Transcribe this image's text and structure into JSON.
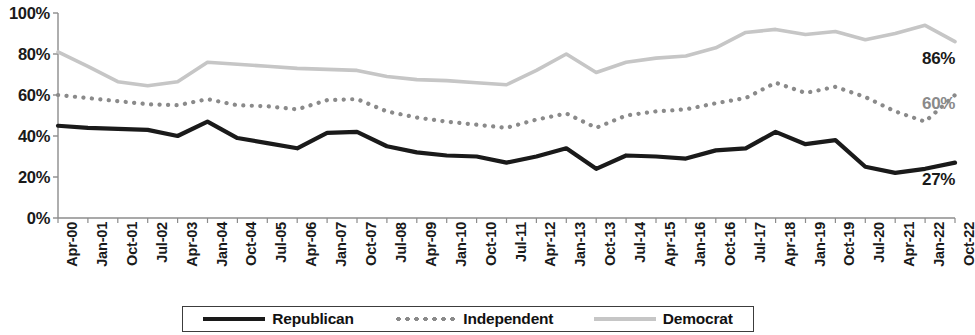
{
  "chart_data": {
    "type": "line",
    "title": "",
    "xlabel": "",
    "ylabel": "",
    "ylim": [
      0,
      100
    ],
    "ytick_labels": [
      "100%",
      "80%",
      "60%",
      "40%",
      "20%",
      "0%"
    ],
    "ytick_values": [
      100,
      80,
      60,
      40,
      20,
      0
    ],
    "grid": false,
    "legend_position": "bottom",
    "categories": [
      "Apr-00",
      "Jan-01",
      "Oct-01",
      "Jul-02",
      "Apr-03",
      "Jan-04",
      "Oct-04",
      "Jul-05",
      "Apr-06",
      "Jan-07",
      "Oct-07",
      "Jul-08",
      "Apr-09",
      "Jan-10",
      "Oct-10",
      "Jul-11",
      "Apr-12",
      "Jan-13",
      "Oct-13",
      "Jul-14",
      "Apr-15",
      "Jan-16",
      "Oct-16",
      "Jul-17",
      "Apr-18",
      "Jan-19",
      "Oct-19",
      "Jul-20",
      "Apr-21",
      "Jan-22",
      "Oct-22"
    ],
    "series": [
      {
        "name": "Republican",
        "color": "#1a1a1a",
        "style": "solid",
        "end_label": "27%",
        "values": [
          45,
          44,
          43.5,
          43,
          40,
          47,
          39,
          36.5,
          34,
          41.5,
          42,
          35,
          32,
          30.5,
          30,
          27,
          30,
          34,
          24,
          30.5,
          30,
          29,
          33,
          34,
          42,
          36,
          38,
          25,
          22,
          24,
          27
        ]
      },
      {
        "name": "Independent",
        "color": "#8a8a8a",
        "style": "dotted",
        "end_label": "60%",
        "values": [
          60,
          58.5,
          57,
          55.5,
          55,
          58,
          55,
          54.5,
          53,
          57.5,
          58,
          52,
          49,
          47,
          45.5,
          44,
          48,
          51,
          44,
          50,
          52,
          53,
          56,
          58.5,
          66,
          61,
          64,
          59,
          52,
          47,
          60
        ]
      },
      {
        "name": "Democrat",
        "color": "#c6c6c6",
        "style": "solid",
        "end_label": "86%",
        "values": [
          81,
          74,
          66.5,
          64.5,
          66.5,
          76,
          75,
          74,
          73,
          72.5,
          72,
          69,
          67.5,
          67,
          66,
          65,
          72,
          80,
          71,
          76,
          78,
          79,
          83,
          90.5,
          92,
          89.5,
          91,
          87,
          90,
          94,
          86
        ]
      }
    ]
  },
  "legend": {
    "items": [
      {
        "label": "Republican"
      },
      {
        "label": "Independent"
      },
      {
        "label": "Democrat"
      }
    ]
  }
}
